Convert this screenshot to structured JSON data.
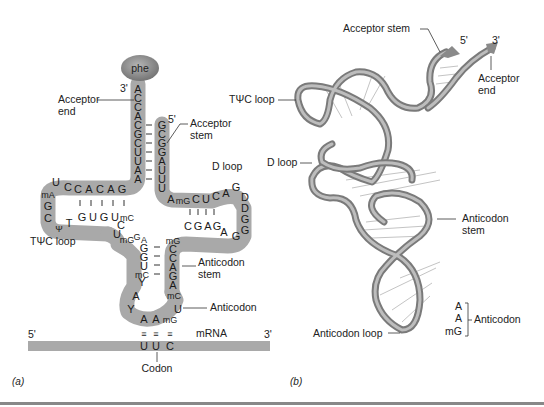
{
  "figure": {
    "panels": [
      "(a)",
      "(b)"
    ],
    "colors": {
      "backbone": "#a9a9a9",
      "phe_oval": "#8a8a8a",
      "ribbon": "#8f8f8f",
      "ribbon_highlight": "#d8d8d8",
      "mrna_bar": "#a9a9a9",
      "rule": "#888888"
    }
  },
  "panel_a": {
    "amino_acid": "phe",
    "acceptor_3prime_label": "3'",
    "acceptor_5prime_label": "5'",
    "acceptor_end_label_1": "Acceptor",
    "acceptor_end_label_2": "end",
    "acceptor_stem_label_1": "Acceptor",
    "acceptor_stem_label_2": "stem",
    "d_loop_label": "D loop",
    "tpsic_loop_label": "TΨC loop",
    "anticodon_stem_label_1": "Anticodon",
    "anticodon_stem_label_2": "stem",
    "anticodon_label": "Anticodon",
    "mrna_label": "mRNA",
    "mrna_5prime": "5'",
    "mrna_3prime": "3'",
    "codon_label": "Codon",
    "strand_3prime": [
      "A",
      "C",
      "C",
      "A",
      "C",
      "G",
      "C",
      "U",
      "U",
      "A",
      "A"
    ],
    "strand_5prime": [
      "G",
      "C",
      "G",
      "G",
      "A",
      "U",
      "U",
      "U"
    ],
    "tpsic_top": [
      "C",
      "A",
      "C",
      "A",
      "G"
    ],
    "tpsic_bottom": [
      "G",
      "U",
      "G",
      "U",
      "mC"
    ],
    "tpsic_loop": [
      "C",
      "U",
      "mA",
      "G",
      "C",
      "Ψ",
      "T"
    ],
    "d_top": [
      "A",
      "mG",
      "C",
      "U",
      "C"
    ],
    "d_bottom": [
      "C",
      "G",
      "A",
      "G"
    ],
    "d_loop": [
      "A",
      "G",
      "D",
      "D",
      "G",
      "G",
      "G",
      "A"
    ],
    "variable_loop": [
      "C",
      "U",
      "mG",
      "G"
    ],
    "ac_left": [
      "A",
      "G",
      "G",
      "U",
      "mC",
      "Y",
      "A",
      "Y"
    ],
    "ac_right": [
      "mG",
      "C",
      "C",
      "A",
      "G",
      "A",
      "mC",
      "U"
    ],
    "anticodon": [
      "A",
      "A",
      "mG"
    ],
    "codon": [
      "U",
      "U",
      "C"
    ],
    "pairing_mark": "≡"
  },
  "panel_b": {
    "acceptor_stem_label": "Acceptor stem",
    "five_prime": "5'",
    "three_prime": "3'",
    "acceptor_end_label_1": "Acceptor",
    "acceptor_end_label_2": "end",
    "tpsic_loop_label": "TΨC loop",
    "d_loop_label": "D loop",
    "anticodon_stem_label_1": "Anticodon",
    "anticodon_stem_label_2": "stem",
    "anticodon_loop_label": "Anticodon loop",
    "anticodon_bases": [
      "A",
      "A",
      "mG"
    ],
    "anticodon_label": "Anticodon"
  }
}
